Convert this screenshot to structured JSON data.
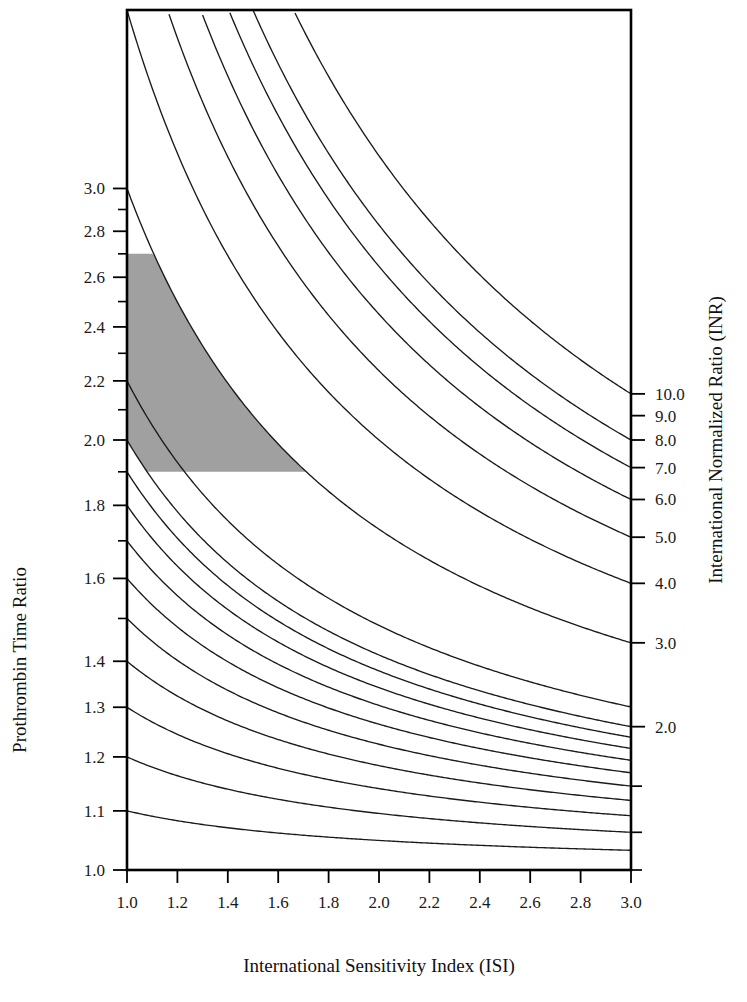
{
  "figure": {
    "kind": "nomogram",
    "background_color": "#ffffff",
    "line_color": "#1a1a1a",
    "band_color": "#a0a0a0"
  },
  "axes": {
    "x": {
      "title": "International Sensitivity Index (ISI)",
      "min": 1.0,
      "max": 3.0,
      "scale": "linear",
      "tick_labels": [
        "1.0",
        "1.2",
        "1.4",
        "1.6",
        "1.8",
        "2.0",
        "2.2",
        "2.4",
        "2.6",
        "2.8",
        "3.0"
      ],
      "tick_values": [
        1.0,
        1.2,
        1.4,
        1.6,
        1.8,
        2.0,
        2.2,
        2.4,
        2.6,
        2.8,
        3.0
      ]
    },
    "y_left": {
      "title": "Prothrombin Time Ratio",
      "min": 1.0,
      "max": 4.0,
      "scale": "log",
      "tick_labels": [
        "3.0",
        "2.8",
        "2.6",
        "2.4",
        "2.2",
        "2.0",
        "1.8",
        "1.6",
        "1.4",
        "1.3",
        "1.2",
        "1.1",
        "1.0"
      ],
      "tick_values": [
        3.0,
        2.8,
        2.6,
        2.4,
        2.2,
        2.0,
        1.8,
        1.6,
        1.4,
        1.3,
        1.2,
        1.1,
        1.0
      ],
      "minor_tick_values": [
        2.9,
        2.7,
        2.5,
        2.3,
        2.1,
        1.9,
        1.7,
        1.5
      ]
    },
    "y_right": {
      "title": "International Normalized Ratio (INR)",
      "scale": "log",
      "tick_labels": [
        "10.0",
        "9.0",
        "8.0",
        "7.0",
        "6.0",
        "5.0",
        "4.0",
        "3.0",
        "2.0"
      ],
      "tick_values": [
        10.0,
        9.0,
        8.0,
        7.0,
        6.0,
        5.0,
        4.0,
        3.0,
        2.0
      ],
      "extra_tick_values": [
        1.5,
        1.2,
        1.0
      ]
    }
  },
  "chart_data": {
    "type": "line",
    "title": "",
    "subtitle": "",
    "xlabel": "International Sensitivity Index (ISI)",
    "ylabel": "Prothrombin Time Ratio",
    "y2label": "International Normalized Ratio (INR)",
    "xlim": [
      1.0,
      3.0
    ],
    "ylim": [
      1.0,
      4.0
    ],
    "yscale": "log",
    "xscale": "linear",
    "grid": false,
    "legend": "none",
    "relation": "PTR = INR^(1/ISI)",
    "x": [
      1.0,
      1.2,
      1.4,
      1.6,
      1.8,
      2.0,
      2.2,
      2.4,
      2.6,
      2.8,
      3.0
    ],
    "series": [
      {
        "name": "INR 10.0",
        "inr": 10.0,
        "values": [
          10.0,
          5.95,
          4.36,
          3.62,
          3.2,
          2.92,
          2.73,
          2.59,
          2.48,
          2.39,
          2.32
        ]
      },
      {
        "name": "INR 8.0",
        "inr": 8.0,
        "values": [
          8.0,
          5.16,
          3.91,
          3.3,
          2.95,
          2.72,
          2.55,
          2.43,
          2.34,
          2.26,
          2.2
        ]
      },
      {
        "name": "INR 7.0",
        "inr": 7.0,
        "values": [
          7.0,
          4.74,
          3.66,
          3.13,
          2.81,
          2.61,
          2.46,
          2.35,
          2.26,
          2.2,
          2.14
        ]
      },
      {
        "name": "INR 6.0",
        "inr": 6.0,
        "values": [
          6.0,
          4.3,
          3.4,
          2.94,
          2.67,
          2.49,
          2.36,
          2.26,
          2.18,
          2.12,
          2.07
        ]
      },
      {
        "name": "INR 5.0",
        "inr": 5.0,
        "values": [
          5.0,
          3.82,
          3.11,
          2.74,
          2.51,
          2.36,
          2.25,
          2.16,
          2.09,
          2.04,
          1.99
        ]
      },
      {
        "name": "INR 4.0",
        "inr": 4.0,
        "values": [
          4.0,
          3.29,
          2.78,
          2.5,
          2.32,
          2.2,
          2.11,
          2.04,
          1.98,
          1.94,
          1.9
        ]
      },
      {
        "name": "INR 3.0",
        "inr": 3.0,
        "values": [
          3.0,
          2.68,
          2.37,
          2.19,
          2.07,
          1.98,
          1.92,
          1.87,
          1.83,
          1.79,
          1.77
        ]
      },
      {
        "name": "INR 2.2",
        "inr": 2.2,
        "values": [
          2.2,
          2.05,
          1.89,
          1.79,
          1.72,
          1.67,
          1.63,
          1.6,
          1.57,
          1.55,
          1.53
        ]
      },
      {
        "name": "INR 2.0",
        "inr": 2.0,
        "values": [
          2.0,
          1.89,
          1.77,
          1.68,
          1.63,
          1.59,
          1.55,
          1.53,
          1.51,
          1.49,
          1.47
        ]
      },
      {
        "name": "INR 1.9",
        "inr": 1.9,
        "values": [
          1.9,
          1.8,
          1.7,
          1.63,
          1.57,
          1.53,
          1.5,
          1.48,
          1.46,
          1.44,
          1.43
        ]
      },
      {
        "name": "INR 1.8",
        "inr": 1.8,
        "values": [
          1.8,
          1.72,
          1.63,
          1.57,
          1.52,
          1.49,
          1.46,
          1.44,
          1.42,
          1.4,
          1.39
        ]
      },
      {
        "name": "INR 1.7",
        "inr": 1.7,
        "values": [
          1.7,
          1.63,
          1.56,
          1.51,
          1.47,
          1.44,
          1.42,
          1.4,
          1.38,
          1.37,
          1.36
        ]
      },
      {
        "name": "INR 1.6",
        "inr": 1.6,
        "values": [
          1.6,
          1.55,
          1.49,
          1.45,
          1.42,
          1.39,
          1.37,
          1.36,
          1.34,
          1.33,
          1.32
        ]
      },
      {
        "name": "INR 1.5",
        "inr": 1.5,
        "values": [
          1.5,
          1.46,
          1.41,
          1.38,
          1.35,
          1.33,
          1.32,
          1.3,
          1.29,
          1.28,
          1.28
        ]
      },
      {
        "name": "INR 1.4",
        "inr": 1.4,
        "values": [
          1.4,
          1.37,
          1.33,
          1.31,
          1.29,
          1.27,
          1.26,
          1.25,
          1.24,
          1.23,
          1.23
        ]
      },
      {
        "name": "INR 1.3",
        "inr": 1.3,
        "values": [
          1.3,
          1.28,
          1.25,
          1.23,
          1.22,
          1.21,
          1.2,
          1.19,
          1.18,
          1.18,
          1.17
        ]
      },
      {
        "name": "INR 1.2",
        "inr": 1.2,
        "values": [
          1.2,
          1.19,
          1.18,
          1.17,
          1.16,
          1.15,
          1.14,
          1.14,
          1.13,
          1.13,
          1.13
        ]
      },
      {
        "name": "INR 1.1",
        "inr": 1.1,
        "values": [
          1.1,
          1.1,
          1.09,
          1.08,
          1.08,
          1.07,
          1.07,
          1.07,
          1.06,
          1.06,
          1.06
        ]
      }
    ],
    "shaded_band": {
      "label": "therapeutic range",
      "color": "#a0a0a0",
      "inr_lower": 2.0,
      "inr_upper": 3.0,
      "ptr_cap_top": 2.7,
      "ptr_cap_bottom": 1.9,
      "x_range": [
        1.0,
        3.0
      ]
    }
  }
}
